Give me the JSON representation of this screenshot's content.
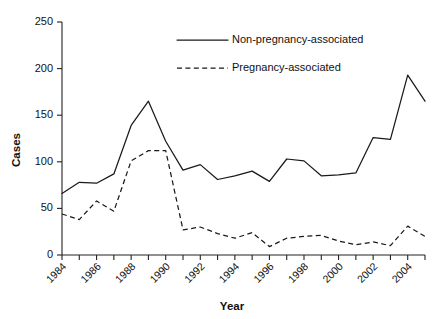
{
  "chart_data": {
    "type": "line",
    "title": "",
    "xlabel": "Year",
    "ylabel": "Cases",
    "xlim": [
      1984,
      2005
    ],
    "ylim": [
      0,
      250
    ],
    "yticks": [
      0,
      50,
      100,
      150,
      200,
      250
    ],
    "xticks": [
      1984,
      1985,
      1986,
      1987,
      1988,
      1989,
      1990,
      1991,
      1992,
      1993,
      1994,
      1995,
      1996,
      1997,
      1998,
      1999,
      2000,
      2001,
      2002,
      2003,
      2004,
      2005
    ],
    "xtick_labels": [
      "1984",
      "",
      "1986",
      "",
      "1988",
      "",
      "1990",
      "",
      "1992",
      "",
      "1994",
      "",
      "1996",
      "",
      "1998",
      "",
      "2000",
      "",
      "2002",
      "",
      "2004",
      ""
    ],
    "grid": false,
    "legend_position": "top-center",
    "x": [
      1984,
      1985,
      1986,
      1987,
      1988,
      1989,
      1990,
      1991,
      1992,
      1993,
      1994,
      1995,
      1996,
      1997,
      1998,
      1999,
      2000,
      2001,
      2002,
      2003,
      2004,
      2005
    ],
    "series": [
      {
        "name": "Non-pregnancy-associated",
        "style": "solid",
        "color": "#1a1a1a",
        "values": [
          66,
          78,
          77,
          87,
          139,
          165,
          122,
          91,
          97,
          81,
          85,
          90,
          79,
          103,
          101,
          85,
          86,
          88,
          126,
          124,
          193,
          165
        ]
      },
      {
        "name": "Pregnancy-associated",
        "style": "dashed",
        "color": "#1a1a1a",
        "values": [
          44,
          38,
          58,
          47,
          101,
          112,
          112,
          27,
          30,
          23,
          18,
          24,
          9,
          18,
          20,
          21,
          15,
          11,
          14,
          10,
          31,
          20
        ]
      }
    ]
  },
  "axes": {
    "y_title": "Cases",
    "x_title": "Year"
  },
  "legend": {
    "items": [
      {
        "label": "Non-pregnancy-associated",
        "style": "solid"
      },
      {
        "label": "Pregnancy-associated",
        "style": "dashed"
      }
    ]
  }
}
